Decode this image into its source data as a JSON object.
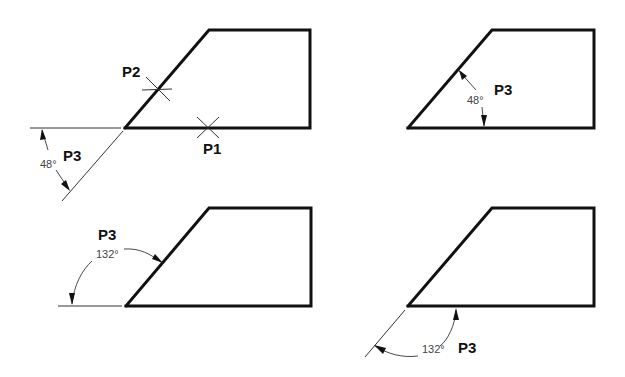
{
  "figures": [
    {
      "id": "top-left",
      "labels": {
        "p1": "P1",
        "p2": "P2",
        "p3": "P3"
      },
      "angle": "48°"
    },
    {
      "id": "top-right",
      "labels": {
        "p3": "P3"
      },
      "angle": "48°"
    },
    {
      "id": "bottom-left",
      "labels": {
        "p3": "P3"
      },
      "angle": "132°"
    },
    {
      "id": "bottom-right",
      "labels": {
        "p3": "P3"
      },
      "angle": "132°"
    }
  ],
  "colors": {
    "line": "#111111",
    "dimension": "#333333",
    "background": "#ffffff"
  }
}
